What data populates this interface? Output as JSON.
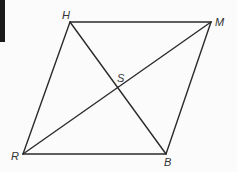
{
  "diagram": {
    "type": "parallelogram-with-diagonals",
    "vertices": [
      {
        "name": "H",
        "x": 70,
        "y": 22,
        "label_x": 62,
        "label_y": 19
      },
      {
        "name": "M",
        "x": 211,
        "y": 22,
        "label_x": 215,
        "label_y": 26
      },
      {
        "name": "B",
        "x": 166,
        "y": 154,
        "label_x": 164,
        "label_y": 166
      },
      {
        "name": "R",
        "x": 23,
        "y": 154,
        "label_x": 11,
        "label_y": 160
      }
    ],
    "intersection": {
      "name": "S",
      "x": 119,
      "y": 89,
      "label_x": 117,
      "label_y": 82
    },
    "sides": [
      "HM",
      "MB",
      "BR",
      "RH"
    ],
    "diagonals": [
      "HB",
      "RM"
    ],
    "labels": {
      "h": "H",
      "m": "M",
      "b": "B",
      "r": "R",
      "s": "S"
    },
    "stroke_color": "#2b2b2b"
  }
}
